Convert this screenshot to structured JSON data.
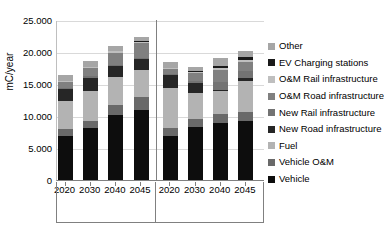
{
  "chart": {
    "type": "bar",
    "title": "",
    "ylabel": "mC/year",
    "xlabel": ""
  },
  "y_axis": {
    "title": "mC/year",
    "ticks": [
      {
        "label": "25.000",
        "value": 25000
      },
      {
        "label": "20.000",
        "value": 20000
      },
      {
        "label": "15.000",
        "value": 15000
      },
      {
        "label": "10.000",
        "value": 10000
      },
      {
        "label": "5.000",
        "value": 5000
      },
      {
        "label": "0",
        "value": 0
      }
    ],
    "min": 0,
    "max": 25000
  },
  "x_axis": {
    "tick_labels": [
      "2020",
      "2030",
      "2040",
      "2045",
      "2020",
      "2030",
      "2040",
      "2045"
    ],
    "groups": [
      {
        "label": "Frozen Policy"
      },
      {
        "label": "IDA2045"
      }
    ]
  },
  "legend": {
    "items": [
      {
        "label": "Other",
        "color": "#a6a6a6"
      },
      {
        "label": "EV Charging stations",
        "color": "#1a1a1a"
      },
      {
        "label": "O&M Rail infrastructure",
        "color": "#bfbfbf"
      },
      {
        "label": "O&M Road infrastructure",
        "color": "#808080"
      },
      {
        "label": "New Rail infrastructure",
        "color": "#737373"
      },
      {
        "label": "New Road infrastructure",
        "color": "#262626"
      },
      {
        "label": "Fuel",
        "color": "#b3b3b3"
      },
      {
        "label": "Vehicle O&M",
        "color": "#696969"
      },
      {
        "label": "Vehicle",
        "color": "#0d0d0d"
      }
    ]
  },
  "chart_data": {
    "type": "bar",
    "subtype": "stacked-bar",
    "title": "",
    "xlabel": "",
    "ylabel": "mC/year",
    "ylim": [
      0,
      25000
    ],
    "yticks": [
      0,
      5000,
      10000,
      15000,
      20000,
      25000
    ],
    "ytick_labels": [
      "0",
      "5.000",
      "10.000",
      "15.000",
      "20.000",
      "25.000"
    ],
    "grid": true,
    "legend_position": "right",
    "groups": [
      "Frozen Policy",
      "IDA2045"
    ],
    "categories": [
      "2020",
      "2030",
      "2040",
      "2045",
      "2020",
      "2030",
      "2040",
      "2045"
    ],
    "category_groups": [
      "Frozen Policy",
      "Frozen Policy",
      "Frozen Policy",
      "Frozen Policy",
      "IDA2045",
      "IDA2045",
      "IDA2045",
      "IDA2045"
    ],
    "stack_order_bottom_to_top": [
      "Vehicle",
      "Vehicle O&M",
      "Fuel",
      "New Road infrastructure",
      "New Rail infrastructure",
      "O&M Road infrastructure",
      "O&M Rail infrastructure",
      "EV Charging stations",
      "Other"
    ],
    "series": [
      {
        "name": "Vehicle",
        "color": "#0d0d0d",
        "values": [
          6900,
          8200,
          10100,
          11000,
          6900,
          8300,
          8950,
          9250
        ]
      },
      {
        "name": "Vehicle O&M",
        "color": "#696969",
        "values": [
          1050,
          1100,
          1700,
          1900,
          1300,
          1250,
          1300,
          1400
        ]
      },
      {
        "name": "Fuel",
        "color": "#b3b3b3",
        "values": [
          4400,
          4550,
          4250,
          4250,
          6250,
          4000,
          3600,
          4800
        ]
      },
      {
        "name": "New Road infrastructure",
        "color": "#262626",
        "values": [
          1950,
          2150,
          1700,
          1700,
          1900,
          1650,
          250,
          450
        ]
      },
      {
        "name": "New Rail infrastructure",
        "color": "#737373",
        "values": [
          150,
          200,
          200,
          200,
          150,
          350,
          1200,
          1100
        ]
      },
      {
        "name": "O&M Road infrastructure",
        "color": "#808080",
        "values": [
          900,
          1350,
          1950,
          2300,
          850,
          1200,
          1900,
          1500
        ]
      },
      {
        "name": "O&M Rail infrastructure",
        "color": "#bfbfbf",
        "values": [
          100,
          150,
          200,
          250,
          100,
          150,
          250,
          300
        ]
      },
      {
        "name": "EV Charging stations",
        "color": "#1a1a1a",
        "values": [
          0,
          0,
          100,
          200,
          0,
          100,
          300,
          400
        ]
      },
      {
        "name": "Other",
        "color": "#a6a6a6",
        "values": [
          950,
          900,
          800,
          500,
          1050,
          700,
          1350,
          900
        ]
      }
    ],
    "totals": [
      16400,
      18600,
      21000,
      22300,
      16500,
      17700,
      19100,
      20100
    ]
  }
}
